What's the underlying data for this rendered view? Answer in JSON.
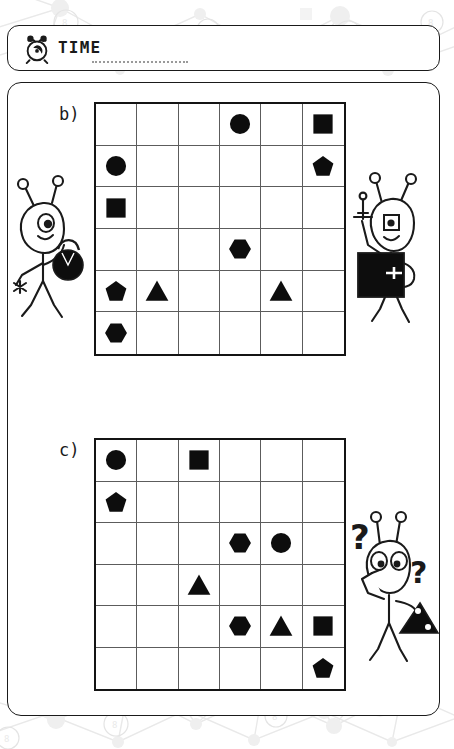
{
  "header": {
    "icon": "alarm-clock-icon",
    "label": "TIME",
    "blank_line": "dotted-answer-line"
  },
  "puzzles": [
    {
      "label": "b)",
      "rows": 6,
      "cols": 6,
      "cells": [
        [
          "",
          "",
          "",
          "circle",
          "",
          "square"
        ],
        [
          "circle",
          "",
          "",
          "",
          "",
          "pentagon"
        ],
        [
          "square",
          "",
          "",
          "",
          "",
          ""
        ],
        [
          "",
          "",
          "",
          "hexagon",
          "",
          ""
        ],
        [
          "pentagon",
          "triangle",
          "",
          "",
          "triangle",
          ""
        ],
        [
          "hexagon",
          "",
          "",
          "",
          "",
          ""
        ]
      ]
    },
    {
      "label": "c)",
      "rows": 6,
      "cols": 6,
      "cells": [
        [
          "circle",
          "",
          "square",
          "",
          "",
          ""
        ],
        [
          "pentagon",
          "",
          "",
          "",
          "",
          ""
        ],
        [
          "",
          "",
          "",
          "hexagon",
          "circle",
          ""
        ],
        [
          "",
          "",
          "triangle",
          "",
          "",
          ""
        ],
        [
          "",
          "",
          "",
          "hexagon",
          "triangle",
          "square"
        ],
        [
          "",
          "",
          "",
          "",
          "",
          "pentagon"
        ]
      ]
    }
  ],
  "characters": [
    {
      "name": "alien-with-bag",
      "eyes": 1,
      "prop": "black-bag"
    },
    {
      "name": "alien-with-tablet",
      "eyes": 1,
      "prop": "black-square-tablet"
    },
    {
      "name": "alien-confused",
      "eyes": 2,
      "prop": "black-triangle",
      "marks": [
        "?",
        "?"
      ]
    }
  ],
  "colors": {
    "ink": "#1a1a1a",
    "grid_line": "#5c5c5c",
    "shape_fill": "#0d0d0d",
    "background_pattern": "#ececec",
    "paper": "#ffffff"
  }
}
